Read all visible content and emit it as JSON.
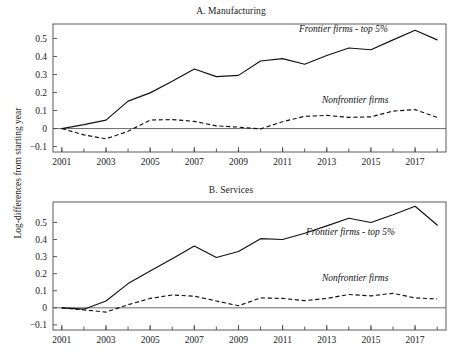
{
  "figure": {
    "ylabel": "Log-differences from starting year",
    "panels": [
      {
        "key": "a",
        "title": "A. Manufacturing"
      },
      {
        "key": "b",
        "title": "B. Services"
      }
    ],
    "annotations": {
      "frontier": "Frontier firms - top 5%",
      "nonfrontier": "Nonfrontier firms"
    }
  },
  "chart_data": [
    {
      "type": "line",
      "panel": "A",
      "title": "A. Manufacturing",
      "xlabel": "",
      "ylabel": "Log-differences from starting year",
      "x": [
        2001,
        2002,
        2003,
        2004,
        2005,
        2006,
        2007,
        2008,
        2009,
        2010,
        2011,
        2012,
        2013,
        2014,
        2015,
        2016,
        2017,
        2018
      ],
      "xlim": [
        2000.6,
        2018.4
      ],
      "ylim": [
        -0.13,
        0.58
      ],
      "yticks": [
        -0.1,
        0,
        0.1,
        0.2,
        0.3,
        0.4,
        0.5
      ],
      "ytick_labels": [
        "−0.1",
        "0",
        "0.1",
        "0.2",
        "0.3",
        "0.4",
        "0.5"
      ],
      "xticks": [
        2001,
        2003,
        2005,
        2007,
        2009,
        2011,
        2013,
        2015,
        2017
      ],
      "xtick_labels": [
        "2001",
        "2003",
        "2005",
        "2007",
        "2009",
        "2011",
        "2013",
        "2015",
        "2017"
      ],
      "grid": false,
      "legend": "inline-annotations",
      "series": [
        {
          "name": "Frontier firms - top 5%",
          "style": "solid",
          "values": [
            0.0,
            0.022,
            0.047,
            0.152,
            0.198,
            0.262,
            0.33,
            0.288,
            0.295,
            0.375,
            0.388,
            0.357,
            0.405,
            0.447,
            0.437,
            0.492,
            0.545,
            0.492
          ]
        },
        {
          "name": "Nonfrontier firms",
          "style": "dashed",
          "values": [
            0.0,
            -0.035,
            -0.057,
            -0.015,
            0.047,
            0.05,
            0.04,
            0.015,
            0.008,
            -0.002,
            0.038,
            0.068,
            0.073,
            0.062,
            0.065,
            0.097,
            0.105,
            0.062
          ]
        }
      ]
    },
    {
      "type": "line",
      "panel": "B",
      "title": "B. Services",
      "xlabel": "",
      "ylabel": "Log-differences from starting year",
      "x": [
        2001,
        2002,
        2003,
        2004,
        2005,
        2006,
        2007,
        2008,
        2009,
        2010,
        2011,
        2012,
        2013,
        2014,
        2015,
        2016,
        2017,
        2018
      ],
      "xlim": [
        2000.6,
        2018.4
      ],
      "ylim": [
        -0.13,
        0.62
      ],
      "yticks": [
        -0.1,
        0,
        0.1,
        0.2,
        0.3,
        0.4,
        0.5
      ],
      "ytick_labels": [
        "−0.1",
        "0",
        "0.1",
        "0.2",
        "0.3",
        "0.4",
        "0.5"
      ],
      "xticks": [
        2001,
        2003,
        2005,
        2007,
        2009,
        2011,
        2013,
        2015,
        2017
      ],
      "xtick_labels": [
        "2001",
        "2003",
        "2005",
        "2007",
        "2009",
        "2011",
        "2013",
        "2015",
        "2017"
      ],
      "grid": false,
      "legend": "inline-annotations",
      "series": [
        {
          "name": "Frontier firms - top 5%",
          "style": "solid",
          "values": [
            0.0,
            -0.008,
            0.04,
            0.142,
            0.215,
            0.288,
            0.362,
            0.295,
            0.33,
            0.405,
            0.4,
            0.437,
            0.48,
            0.525,
            0.5,
            0.545,
            0.595,
            0.485
          ]
        },
        {
          "name": "Nonfrontier firms",
          "style": "dashed",
          "values": [
            0.0,
            -0.012,
            -0.025,
            0.018,
            0.055,
            0.075,
            0.068,
            0.04,
            0.012,
            0.058,
            0.055,
            0.042,
            0.055,
            0.078,
            0.07,
            0.085,
            0.058,
            0.052
          ]
        }
      ]
    }
  ]
}
